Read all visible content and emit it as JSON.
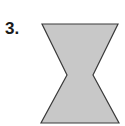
{
  "problem": {
    "number_label": "3."
  },
  "figure": {
    "shape": "hourglass-polygon",
    "fill_color": "#c8c8c8",
    "stroke_color": "#3a3a3a",
    "vertices": [
      [
        42,
        24
      ],
      [
        118,
        24
      ],
      [
        93,
        75
      ],
      [
        119,
        123
      ],
      [
        41,
        123
      ],
      [
        67,
        75
      ]
    ]
  }
}
